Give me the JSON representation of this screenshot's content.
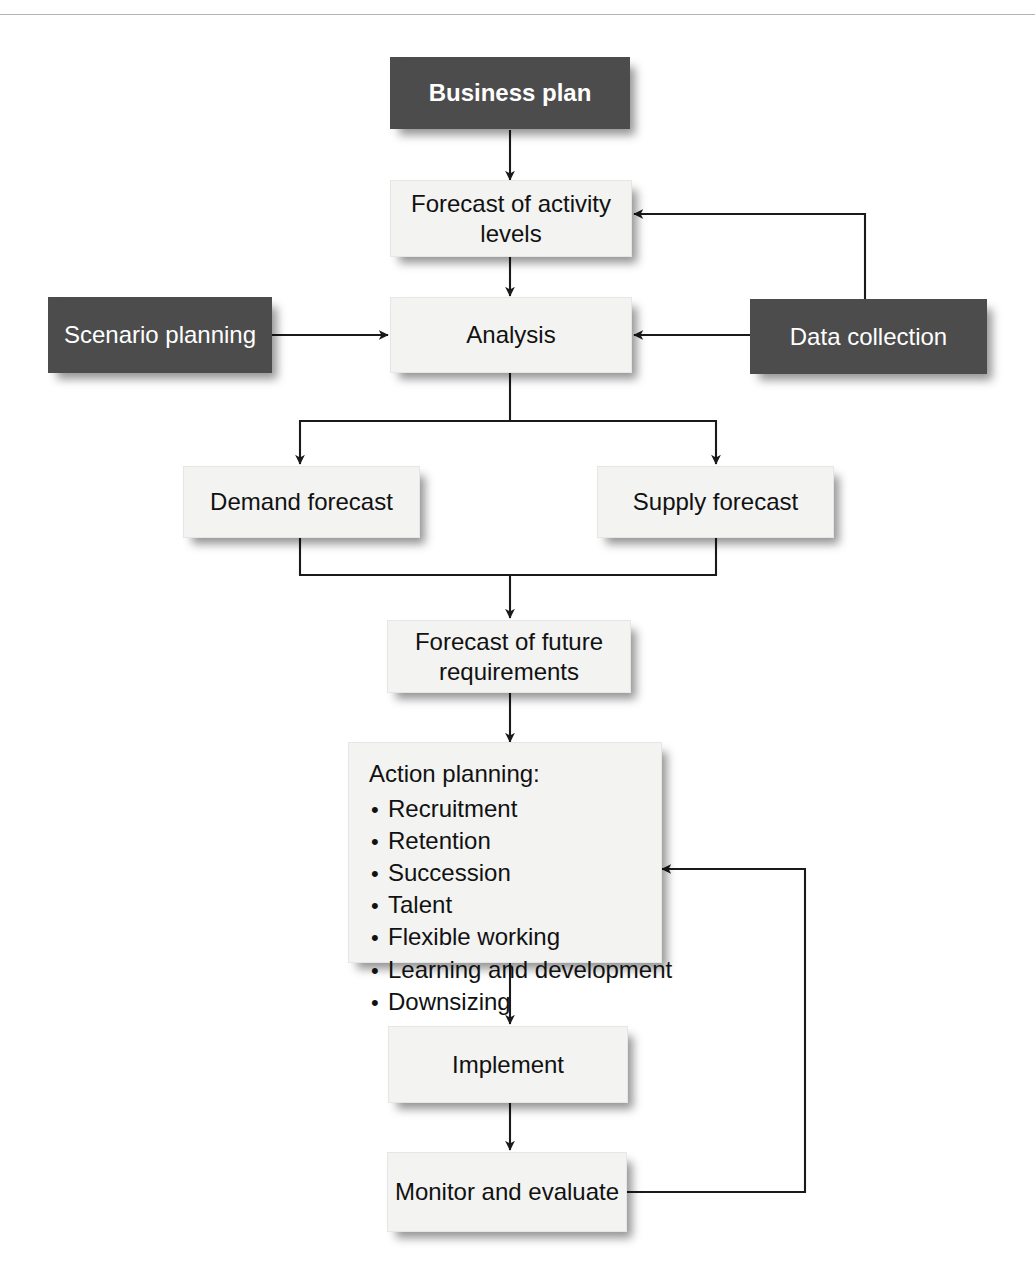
{
  "diagram": {
    "colors": {
      "dark_box": "#4c4c4c",
      "light_box": "#f3f3f1",
      "dark_box_text": "#ffffff",
      "light_box_text": "#111111",
      "connector": "#1a1a1a",
      "page_background": "#ffffff"
    },
    "nodes": {
      "business_plan": "Business plan",
      "forecast_activity": "Forecast of activity\nlevels",
      "forecast_activity_line1": "Forecast of activity",
      "forecast_activity_line2": "levels",
      "scenario_planning": "Scenario planning",
      "analysis": "Analysis",
      "data_collection": "Data collection",
      "demand_forecast": "Demand forecast",
      "supply_forecast": "Supply forecast",
      "forecast_future_line1": "Forecast of future",
      "forecast_future_line2": "requirements",
      "action_planning_title": "Action planning:",
      "action_planning_items": [
        "Recruitment",
        "Retention",
        "Succession",
        "Talent",
        "Flexible working",
        "Learning and development",
        "Downsizing"
      ],
      "implement": "Implement",
      "monitor_evaluate": "Monitor and evaluate"
    },
    "edges": [
      {
        "from": "business_plan",
        "to": "forecast_activity",
        "style": "arrow-down"
      },
      {
        "from": "forecast_activity",
        "to": "analysis",
        "style": "arrow-down"
      },
      {
        "from": "scenario_planning",
        "to": "analysis",
        "style": "arrow-right"
      },
      {
        "from": "data_collection",
        "to": "analysis",
        "style": "arrow-left"
      },
      {
        "from": "data_collection",
        "to": "forecast_activity",
        "style": "elbow-up-left-arrow"
      },
      {
        "from": "analysis",
        "to": "demand_forecast",
        "style": "split-down-left-arrow"
      },
      {
        "from": "analysis",
        "to": "supply_forecast",
        "style": "split-down-right-arrow"
      },
      {
        "from": "demand_forecast",
        "to": "forecast_future",
        "style": "merge-down-arrow"
      },
      {
        "from": "supply_forecast",
        "to": "forecast_future",
        "style": "merge-down-arrow"
      },
      {
        "from": "forecast_future",
        "to": "action_planning",
        "style": "arrow-down"
      },
      {
        "from": "action_planning",
        "to": "implement",
        "style": "arrow-down"
      },
      {
        "from": "implement",
        "to": "monitor_evaluate",
        "style": "arrow-down"
      },
      {
        "from": "monitor_evaluate",
        "to": "action_planning",
        "style": "feedback-loop-right-arrow"
      }
    ]
  }
}
